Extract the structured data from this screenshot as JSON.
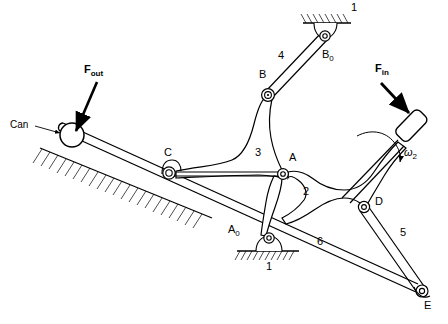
{
  "figure": {
    "kind": "kinematic-linkage-diagram",
    "background_color": "#ffffff",
    "line_color": "#000000",
    "width": 448,
    "height": 324
  },
  "labels": {
    "force_out": {
      "text": "F",
      "sub": "out",
      "x": 84,
      "y": 70
    },
    "force_in": {
      "text": "F",
      "sub": "in",
      "x": 375,
      "y": 69
    },
    "can": {
      "text": "Can",
      "x": 12,
      "y": 123
    },
    "omega2": {
      "text": "ω",
      "sub": "2",
      "x": 404,
      "y": 153
    },
    "joint_A": {
      "text": "A",
      "sub": "",
      "x": 289,
      "y": 158
    },
    "joint_A0": {
      "text": "A",
      "sub": "0",
      "x": 228,
      "y": 229
    },
    "joint_B": {
      "text": "B",
      "sub": "",
      "x": 261,
      "y": 74
    },
    "joint_B0": {
      "text": "B",
      "sub": "0",
      "x": 324,
      "y": 54
    },
    "joint_C": {
      "text": "C",
      "sub": "",
      "x": 164,
      "y": 152
    },
    "joint_D": {
      "text": "D",
      "sub": "",
      "x": 375,
      "y": 200
    },
    "joint_E": {
      "text": "E",
      "sub": "",
      "x": 424,
      "y": 305
    },
    "link_1_top": {
      "text": "1",
      "x": 351,
      "y": 6
    },
    "link_1_bottom": {
      "text": "1",
      "x": 266,
      "y": 264
    },
    "link_2": {
      "text": "2",
      "x": 303,
      "y": 191
    },
    "link_3": {
      "text": "3",
      "x": 255,
      "y": 152
    },
    "link_4": {
      "text": "4",
      "x": 278,
      "y": 55
    },
    "link_5": {
      "text": "5",
      "x": 400,
      "y": 232
    },
    "link_6": {
      "text": "6",
      "x": 317,
      "y": 240
    }
  },
  "joints": {
    "A": {
      "x": 283,
      "y": 174
    },
    "A0": {
      "x": 269,
      "y": 238
    },
    "B": {
      "x": 268,
      "y": 95
    },
    "B0": {
      "x": 325,
      "y": 36
    },
    "C": {
      "x": 169,
      "y": 173
    },
    "D": {
      "x": 364,
      "y": 207
    },
    "E": {
      "x": 422,
      "y": 291
    }
  },
  "can": {
    "cx": 72,
    "cy": 135,
    "r": 12
  },
  "handle": {
    "cx": 415,
    "cy": 125,
    "angle_deg": 40
  },
  "ground": {
    "top_hatch": {
      "x": 303,
      "y": 14,
      "w": 48,
      "h": 9
    },
    "bottom_hatch": {
      "x": 237,
      "y": 251,
      "w": 62,
      "h": 9
    },
    "incline_hatch_note": "hatched inclined surface under the can at left"
  }
}
